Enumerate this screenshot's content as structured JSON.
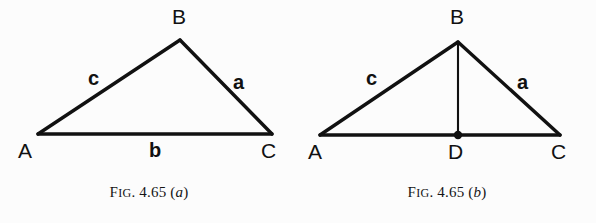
{
  "page": {
    "background_color": "#fcfcfc",
    "ink_color": "#111111",
    "width": 596,
    "height": 223
  },
  "figures": [
    {
      "id": "figure-a",
      "caption": {
        "prefix_cap": "F",
        "prefix_smallcaps": "IG",
        "number": ". 4.65 (",
        "letter": "a",
        "suffix": ")",
        "full_text": "FIG. 4.65 (a)"
      },
      "vertices": [
        {
          "name": "A",
          "label": "A",
          "x": 38,
          "y": 134,
          "label_x": 18,
          "label_y": 146
        },
        {
          "name": "B",
          "label": "B",
          "x": 180,
          "y": 40,
          "label_x": 172,
          "label_y": 8
        },
        {
          "name": "C",
          "label": "C",
          "x": 272,
          "y": 134,
          "label_x": 262,
          "label_y": 146
        }
      ],
      "sides": [
        {
          "name": "c",
          "label": "c",
          "from": "A",
          "to": "B",
          "label_x": 88,
          "label_y": 70
        },
        {
          "name": "a",
          "label": "a",
          "from": "B",
          "to": "C",
          "label_x": 232,
          "label_y": 74
        },
        {
          "name": "b",
          "label": "b",
          "from": "A",
          "to": "C",
          "label_x": 150,
          "label_y": 146
        }
      ],
      "altitude": null,
      "foot_point": null
    },
    {
      "id": "figure-b",
      "caption": {
        "prefix_cap": "F",
        "prefix_smallcaps": "IG",
        "number": ". 4.65 (",
        "letter": "b",
        "suffix": ")",
        "full_text": "FIG. 4.65 (b)"
      },
      "vertices": [
        {
          "name": "A",
          "label": "A",
          "x": 22,
          "y": 135,
          "label_x": 10,
          "label_y": 147
        },
        {
          "name": "B",
          "label": "B",
          "x": 160,
          "y": 42,
          "label_x": 152,
          "label_y": 8
        },
        {
          "name": "C",
          "label": "C",
          "x": 262,
          "y": 135,
          "label_x": 254,
          "label_y": 147
        },
        {
          "name": "D",
          "label": "D",
          "x": 160,
          "y": 135,
          "label_x": 150,
          "label_y": 147
        }
      ],
      "sides": [
        {
          "name": "c",
          "label": "c",
          "from": "A",
          "to": "B",
          "label_x": 68,
          "label_y": 70
        },
        {
          "name": "a",
          "label": "a",
          "from": "B",
          "to": "C",
          "label_x": 218,
          "label_y": 74
        }
      ],
      "altitude": {
        "from": "B",
        "to": "D"
      },
      "foot_point": {
        "name": "D",
        "x": 160,
        "y": 135,
        "radius": 4
      }
    }
  ]
}
